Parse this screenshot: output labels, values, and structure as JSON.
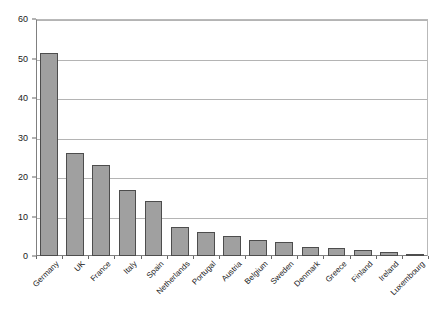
{
  "chart_data": {
    "type": "bar",
    "title": "",
    "subtitle": "",
    "xlabel": "",
    "ylabel": "",
    "ylim": [
      0,
      60
    ],
    "ytick_interval": 10,
    "yticks": [
      0,
      10,
      20,
      30,
      40,
      50,
      60
    ],
    "ytick_labels": [
      "0",
      "10",
      "20",
      "30",
      "40",
      "50",
      "60"
    ],
    "grid": "horizontal",
    "legend": "none",
    "categories": [
      "Germany",
      "UK",
      "France",
      "Italy",
      "Spain",
      "Netherlands",
      "Portugal",
      "Austria",
      "Belgium",
      "Sweden",
      "Denmark",
      "Greece",
      "Finland",
      "Ireland",
      "Luxembourg"
    ],
    "values": [
      51.5,
      26.2,
      23.0,
      16.6,
      14.0,
      7.4,
      6.2,
      5.1,
      4.0,
      3.6,
      2.3,
      2.0,
      1.6,
      1.0,
      0.3
    ],
    "series": [
      {
        "name": "",
        "values": [
          51.5,
          26.2,
          23.0,
          16.6,
          14.0,
          7.4,
          6.2,
          5.1,
          4.0,
          3.6,
          2.3,
          2.0,
          1.6,
          1.0,
          0.3
        ]
      }
    ],
    "colors": {
      "bar_fill": "#a0a0a0",
      "bar_border": "#4d4d4d",
      "gridline": "#b4b4b4",
      "axis": "#808080",
      "plot_border": "#b9b9b9",
      "text": "#1a1a1a",
      "background": "#ffffff"
    }
  }
}
